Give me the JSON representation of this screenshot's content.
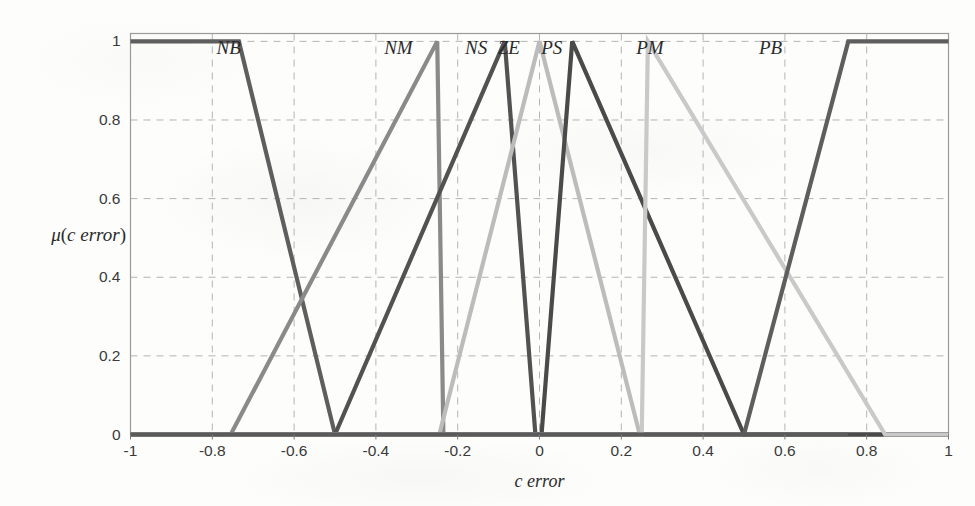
{
  "chart_data": {
    "type": "line",
    "title": "",
    "xlabel": "c  error",
    "ylabel_mu": "μ",
    "ylabel_arg": "c  error",
    "ylabel_full": "μ(c  error)",
    "xlim": [
      -1,
      1
    ],
    "ylim": [
      0,
      1.02
    ],
    "grid": true,
    "grid_style": "dashed",
    "legend": "inline-peak-labels",
    "xticks": [
      -1,
      -0.8,
      -0.6,
      -0.4,
      -0.2,
      0,
      0.2,
      0.4,
      0.6,
      0.8,
      1
    ],
    "xticklabels": [
      "-1",
      "-0.8",
      "-0.6",
      "-0.4",
      "-0.2",
      "0",
      "0.2",
      "0.4",
      "0.6",
      "0.8",
      "1"
    ],
    "yticks": [
      0,
      0.2,
      0.4,
      0.6,
      0.8,
      1
    ],
    "yticklabels": [
      "0",
      "0.2",
      "0.4",
      "0.6",
      "0.8",
      "1"
    ],
    "series": [
      {
        "name": "NB",
        "label": "NB",
        "label_x": -0.76,
        "color": "#5e5e5e",
        "points": [
          [
            -1,
            1
          ],
          [
            -0.735,
            1
          ],
          [
            -0.5,
            0
          ],
          [
            1,
            0
          ]
        ]
      },
      {
        "name": "NM",
        "label": "NM",
        "label_x": -0.345,
        "color": "#8a8a8a",
        "points": [
          [
            -1,
            0
          ],
          [
            -0.755,
            0
          ],
          [
            -0.25,
            1
          ],
          [
            -0.235,
            0
          ],
          [
            1,
            0
          ]
        ]
      },
      {
        "name": "NS",
        "label": "NS",
        "label_x": -0.155,
        "color": "#525252",
        "points": [
          [
            -1,
            0
          ],
          [
            -0.5,
            0
          ],
          [
            -0.085,
            1
          ],
          [
            -0.01,
            0
          ],
          [
            1,
            0
          ]
        ]
      },
      {
        "name": "ZE",
        "label": "ZE",
        "label_x": -0.075,
        "color": "#bcbcbc",
        "points": [
          [
            -1,
            0
          ],
          [
            -0.245,
            0
          ],
          [
            0,
            1
          ],
          [
            0.245,
            0
          ],
          [
            1,
            0
          ]
        ]
      },
      {
        "name": "PS",
        "label": "PS",
        "label_x": 0.03,
        "color": "#4a4a4a",
        "points": [
          [
            -1,
            0
          ],
          [
            0.005,
            0
          ],
          [
            0.08,
            1
          ],
          [
            0.5,
            0
          ],
          [
            1,
            0
          ]
        ]
      },
      {
        "name": "PM",
        "label": "PM",
        "label_x": 0.27,
        "color": "#c9c9c9",
        "points": [
          [
            -1,
            0
          ],
          [
            0.25,
            0
          ],
          [
            0.265,
            1
          ],
          [
            0.845,
            0
          ],
          [
            1,
            0
          ]
        ]
      },
      {
        "name": "PB",
        "label": "PB",
        "label_x": 0.565,
        "color": "#5e5e5e",
        "points": [
          [
            -1,
            0
          ],
          [
            0.5,
            0
          ],
          [
            0.755,
            1
          ],
          [
            1,
            1
          ]
        ]
      }
    ]
  },
  "axes": {
    "frame_color": "#9a9a9a",
    "grid_color": "#b4b4b4",
    "baseline_color": "#5a5a5a",
    "background": "#fdfdfb"
  }
}
